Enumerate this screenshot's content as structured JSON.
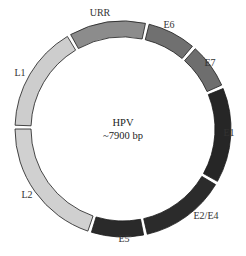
{
  "diagram": {
    "title": "HPV",
    "subtitle": "~7900 bp",
    "center": {
      "cx": 123,
      "cy": 129
    },
    "outer_radius": 108,
    "inner_radius": 92,
    "segments": [
      {
        "name": "URR",
        "start": -29,
        "end": 12,
        "color": "#8c8c8c",
        "label_pos": [
          100,
          16
        ]
      },
      {
        "name": "E6",
        "start": 14,
        "end": 40,
        "color": "#707070",
        "label_pos": [
          169,
          28
        ]
      },
      {
        "name": "E7",
        "start": 42,
        "end": 66,
        "color": "#6e6e6e",
        "label_pos": [
          210,
          66
        ]
      },
      {
        "name": "E1",
        "start": 68,
        "end": 119,
        "color": "#262626",
        "label_pos": [
          229,
          136
        ]
      },
      {
        "name": "E2/E4",
        "start": 121,
        "end": 167,
        "color": "#2b2b2b",
        "label_pos": [
          206,
          219
        ]
      },
      {
        "name": "E5",
        "start": 169,
        "end": 197,
        "color": "#2a2a2a",
        "label_pos": [
          124,
          242
        ]
      },
      {
        "name": "L2",
        "start": 199,
        "end": 270,
        "color": "#d0d0d0",
        "label_pos": [
          27,
          198
        ]
      },
      {
        "name": "L1",
        "start": 272,
        "end": 329,
        "color": "#cdcdcd",
        "label_pos": [
          20,
          76
        ]
      }
    ]
  }
}
